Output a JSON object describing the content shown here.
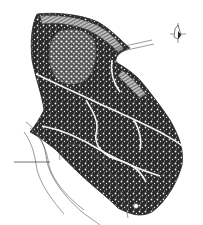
{
  "map": {
    "type": "site-plan",
    "style": "black-and-white line drawing",
    "background": "#ffffff",
    "ink": "#1a1a1a",
    "features": [
      {
        "name": "wooded-park-area",
        "description": "dense stippled tree canopy"
      },
      {
        "name": "clearing",
        "description": "lighter circular clearing in north section"
      },
      {
        "name": "hatched-strips",
        "description": "hatched terrace bands along north-east edge"
      },
      {
        "name": "footpaths",
        "description": "curving paths crossing the woodland"
      },
      {
        "name": "road-curves",
        "description": "curving roads / stream outside south-west"
      },
      {
        "name": "access-road",
        "description": "double line road entering from east"
      },
      {
        "name": "north-arrow",
        "description": "compass symbol top right"
      }
    ]
  }
}
